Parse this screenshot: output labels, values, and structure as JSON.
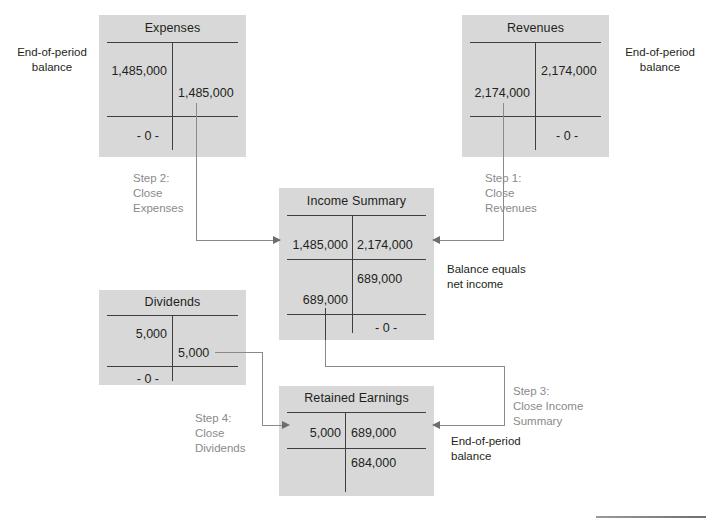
{
  "diagram": {
    "colors": {
      "box": "#d8d8d8",
      "rule": "#3f3f3f",
      "connector": "#8a8a8a",
      "step_text": "#8a8a8a",
      "text": "#231f20"
    }
  },
  "accounts": {
    "expenses": {
      "title": "Expenses",
      "debit": "1,485,000",
      "credit": "1,485,000",
      "balance": "- 0 -"
    },
    "revenues": {
      "title": "Revenues",
      "debit": "2,174,000",
      "credit": "2,174,000",
      "balance": "- 0 -"
    },
    "income_summary": {
      "title": "Income Summary",
      "debit": "1,485,000",
      "credit": "2,174,000",
      "credit_balance": "689,000",
      "closing_debit": "689,000",
      "balance": "- 0 -"
    },
    "dividends": {
      "title": "Dividends",
      "debit": "5,000",
      "credit": "5,000",
      "balance": "- 0 -"
    },
    "retained_earnings": {
      "title": "Retained Earnings",
      "debit": "5,000",
      "credit": "689,000",
      "balance": "684,000"
    }
  },
  "labels": {
    "eop_left": "End-of-period\nbalance",
    "eop_right": "End-of-period\nbalance",
    "eop_retained": "End-of-period\nbalance",
    "balance_equals": "Balance equals\nnet income"
  },
  "steps": {
    "step1": "Step 1:\nClose\nRevenues",
    "step2": "Step 2:\nClose\nExpenses",
    "step3": "Step 3:\nClose Income\nSummary",
    "step4": "Step 4:\nClose\nDividends"
  }
}
